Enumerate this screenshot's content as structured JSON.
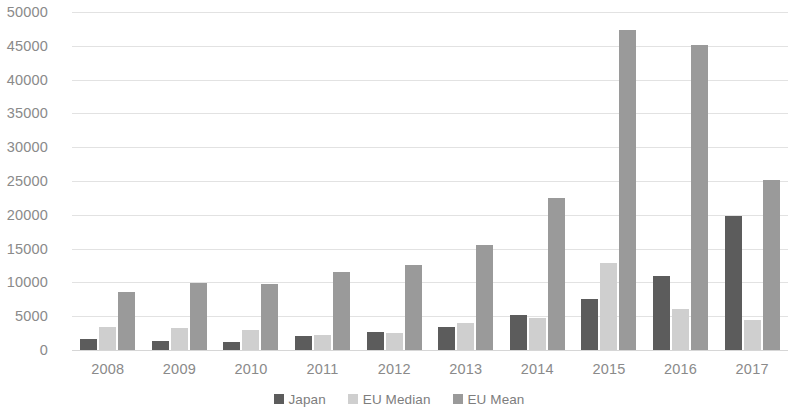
{
  "chart_data": {
    "type": "bar",
    "title": "",
    "subtitle": "",
    "xlabel": "",
    "ylabel": "",
    "categories": [
      "2008",
      "2009",
      "2010",
      "2011",
      "2012",
      "2013",
      "2014",
      "2015",
      "2016",
      "2017"
    ],
    "series": [
      {
        "name": "Japan",
        "color": "#5c5c5c",
        "values": [
          1700,
          1400,
          1200,
          2000,
          2600,
          3400,
          5200,
          7600,
          11000,
          19800
        ]
      },
      {
        "name": "EU Median",
        "color": "#cfcfcf",
        "values": [
          3400,
          3300,
          2900,
          2200,
          2500,
          4000,
          4800,
          12800,
          6000,
          4400
        ]
      },
      {
        "name": "EU Mean",
        "color": "#9a9a9a",
        "values": [
          8600,
          9900,
          9700,
          11600,
          12600,
          15500,
          22500,
          47300,
          45100,
          25200
        ]
      }
    ],
    "ylim": [
      0,
      50000
    ],
    "ytick_step": 5000,
    "ytick_labels": [
      "0",
      "5000",
      "10000",
      "15000",
      "20000",
      "25000",
      "30000",
      "35000",
      "40000",
      "45000",
      "50000"
    ],
    "grid": true,
    "grid_axis": "y",
    "legend_position": "bottom",
    "legend": [
      "Japan",
      "EU Median",
      "EU Mean"
    ],
    "annotations": [],
    "background_color": "#ffffff",
    "gridline_color": "#e2e2e2",
    "tick_label_color": "#8a8a8a"
  }
}
